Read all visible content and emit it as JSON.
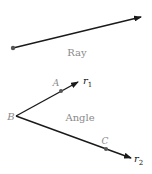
{
  "colors": {
    "stroke": "#1a1a1a",
    "point": "#555555",
    "label": "#8a8a8a",
    "ray_name": "#111111"
  },
  "ray": {
    "label": "Ray"
  },
  "angle": {
    "label": "Angle",
    "vertex_label": "B",
    "point_on_r1_label": "A",
    "point_on_r2_label": "C",
    "ray1_label": "r",
    "ray1_subscript": "1",
    "ray2_label": "r",
    "ray2_subscript": "2"
  }
}
